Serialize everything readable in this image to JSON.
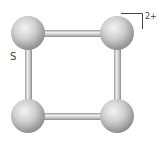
{
  "diagram": {
    "type": "molecular-structure",
    "atom_label": "S",
    "charge_label": "2+",
    "atoms": [
      {
        "id": "top-left",
        "x": 28,
        "y": 33
      },
      {
        "id": "top-right",
        "x": 117,
        "y": 33
      },
      {
        "id": "bottom-left",
        "x": 28,
        "y": 116
      },
      {
        "id": "bottom-right",
        "x": 117,
        "y": 116
      }
    ],
    "bonds": [
      [
        "top-left",
        "top-right"
      ],
      [
        "top-right",
        "bottom-right"
      ],
      [
        "bottom-right",
        "bottom-left"
      ],
      [
        "bottom-left",
        "top-left"
      ]
    ],
    "colors": {
      "atom": "#c8c8c8",
      "atom_highlight": "#f2f2f2",
      "atom_shadow": "#8e8e8e",
      "bond": "#b8b8b8",
      "bracket": "#444444"
    }
  }
}
